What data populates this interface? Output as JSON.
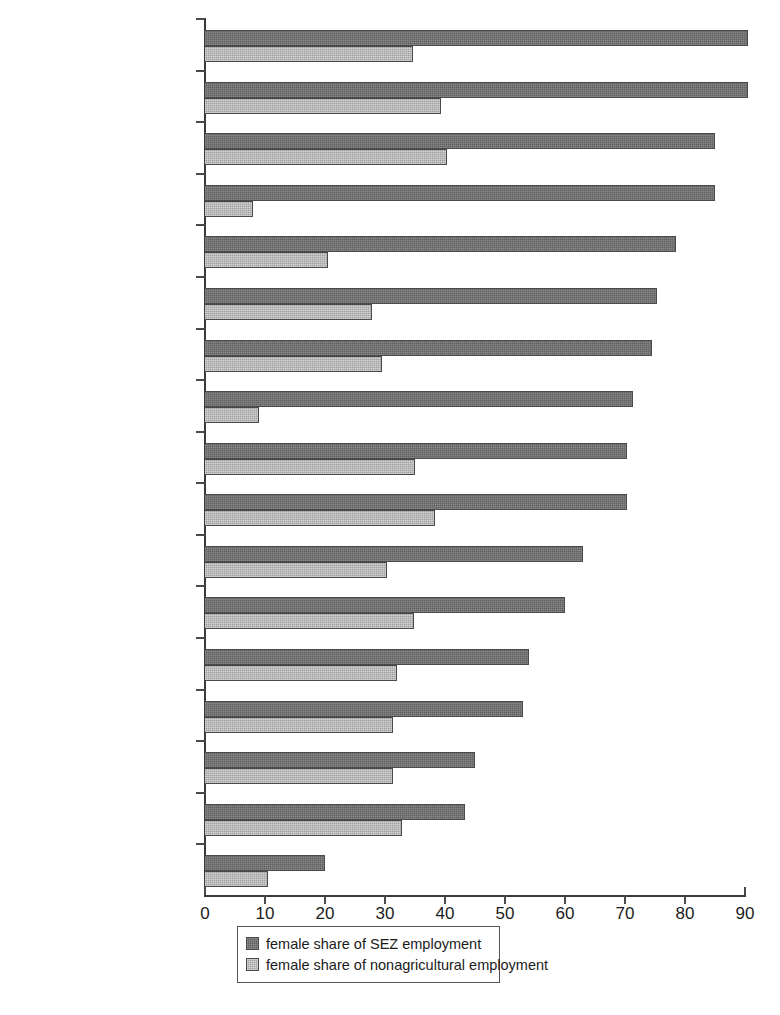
{
  "chart_data": {
    "type": "bar",
    "orientation": "horizontal",
    "title": "",
    "xlabel": "",
    "ylabel": "",
    "xlim": [
      0,
      90
    ],
    "xticks": [
      0,
      10,
      20,
      30,
      40,
      50,
      60,
      70,
      80,
      90
    ],
    "grid": false,
    "legend_position": "bottom",
    "categories": [
      "Nicaragua",
      "Jamaica",
      "El Salvador",
      "Bangaladesh",
      "Sri Lanka",
      "Honduras",
      "Philippines",
      "Madagascar",
      "Panama",
      "Korea, Republic of",
      "Mauritius",
      "Mexico",
      "Malaysia",
      "Dominican Republic",
      "Macedonia",
      "Belize",
      "Morocco"
    ],
    "series": [
      {
        "name": "female share of SEZ employment",
        "color": "#6b6b6b",
        "values": [
          90.5,
          90.5,
          85.0,
          85.0,
          78.5,
          75.3,
          74.5,
          71.3,
          70.3,
          70.3,
          63.0,
          60.0,
          54.0,
          53.0,
          45.0,
          43.3,
          20.0
        ]
      },
      {
        "name": "female share of nonagricultural employment",
        "color": "#b4b4b4",
        "values": [
          34.7,
          39.3,
          40.3,
          8.0,
          20.5,
          27.8,
          29.5,
          9.0,
          35.0,
          38.3,
          30.3,
          34.8,
          32.0,
          31.3,
          31.3,
          32.8,
          10.5
        ]
      }
    ]
  },
  "axis": {
    "x_tick_labels": [
      "0",
      "10",
      "20",
      "30",
      "40",
      "50",
      "60",
      "70",
      "80",
      "90"
    ]
  },
  "legend": {
    "items": [
      {
        "label": "female share of SEZ employment",
        "swatch": "dark-gray-swatch-icon"
      },
      {
        "label": "female share of nonagricultural employment",
        "swatch": "light-gray-swatch-icon"
      }
    ]
  }
}
